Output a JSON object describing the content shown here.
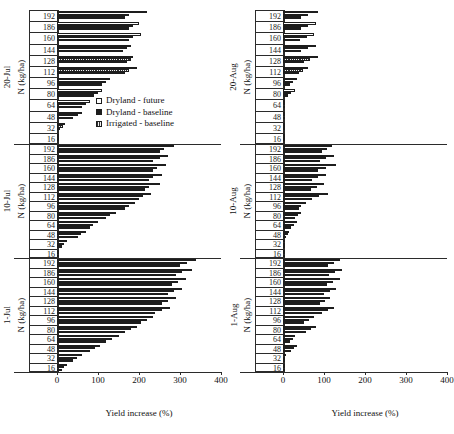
{
  "figure": {
    "xlabel": "Yield increase (%)",
    "ylabel": "N (kg/ha)",
    "legend": [
      {
        "key": "future",
        "label": "Dryland - future"
      },
      {
        "key": "baseline",
        "label": "Dryland - baseline"
      },
      {
        "key": "irrigated",
        "label": "Irrigated - baseline"
      }
    ],
    "xticks": [
      "0",
      "100",
      "200",
      "300",
      "400"
    ],
    "xlim": [
      0,
      400
    ],
    "categories": [
      "16",
      "32",
      "48",
      "64",
      "80",
      "96",
      "112",
      "128",
      "144",
      "160",
      "186",
      "192"
    ]
  },
  "chart_data": {
    "type": "bar",
    "title": "",
    "orientation": "horizontal",
    "xlabel": "Yield increase (%)",
    "ylabel": "N (kg/ha)",
    "xlim": [
      0,
      400
    ],
    "xticks": [
      0,
      100,
      200,
      300,
      400
    ],
    "grid": false,
    "legend_position": "inside-top-left-panel",
    "categories": [
      "16",
      "32",
      "48",
      "64",
      "80",
      "96",
      "112",
      "128",
      "144",
      "160",
      "186",
      "192"
    ],
    "series_names": [
      "Dryland - future",
      "Dryland - baseline",
      "Irrigated - baseline"
    ],
    "panels": [
      {
        "id": "20-jul",
        "label": "20-Jul",
        "column": "left",
        "row": 0,
        "series": [
          {
            "name": "Dryland - future",
            "key": "future",
            "values": [
              0,
              20,
              60,
              80,
              110,
              130,
              195,
              185,
              180,
              205,
              200,
              220
            ]
          },
          {
            "name": "Dryland - baseline",
            "key": "baseline",
            "values": [
              0,
              8,
              40,
              60,
              90,
              110,
              165,
              170,
              160,
              175,
              175,
              165
            ]
          },
          {
            "name": "Irrigated - baseline",
            "key": "irrigated",
            "values": [
              0,
              15,
              50,
              70,
              100,
              120,
              175,
              180,
              170,
              185,
              185,
              175
            ]
          }
        ]
      },
      {
        "id": "10-jul",
        "label": "10-Jul",
        "column": "left",
        "row": 1,
        "series": [
          {
            "name": "Dryland - future",
            "key": "future",
            "values": [
              5,
              25,
              70,
              100,
              145,
              190,
              230,
              250,
              255,
              265,
              270,
              285
            ]
          },
          {
            "name": "Dryland - baseline",
            "key": "baseline",
            "values": [
              2,
              12,
              50,
              80,
              120,
              165,
              200,
              215,
              225,
              235,
              235,
              250
            ]
          },
          {
            "name": "Irrigated - baseline",
            "key": "irrigated",
            "values": [
              3,
              18,
              58,
              88,
              130,
              175,
              210,
              225,
              235,
              245,
              250,
              262
            ]
          }
        ]
      },
      {
        "id": "1-jul",
        "label": "1-Jul",
        "column": "left",
        "row": 2,
        "series": [
          {
            "name": "Dryland - future",
            "key": "future",
            "values": [
              25,
              60,
              105,
              150,
              195,
              235,
              275,
              290,
              305,
              315,
              330,
              340
            ]
          },
          {
            "name": "Dryland - baseline",
            "key": "baseline",
            "values": [
              12,
              38,
              80,
              120,
              165,
              205,
              240,
              255,
              270,
              280,
              290,
              300
            ]
          },
          {
            "name": "Irrigated - baseline",
            "key": "irrigated",
            "values": [
              18,
              48,
              92,
              135,
              180,
              220,
              255,
              270,
              285,
              295,
              305,
              318
            ]
          }
        ]
      },
      {
        "id": "20-aug",
        "label": "20-Aug",
        "column": "right",
        "row": 0,
        "series": [
          {
            "name": "Dryland - future",
            "key": "future",
            "values": [
              0,
              2,
              4,
              6,
              30,
              35,
              60,
              85,
              80,
              75,
              80,
              85
            ]
          },
          {
            "name": "Dryland - baseline",
            "key": "baseline",
            "values": [
              0,
              1,
              2,
              3,
              12,
              16,
              40,
              50,
              45,
              42,
              45,
              45
            ]
          },
          {
            "name": "Irrigated - baseline",
            "key": "irrigated",
            "values": [
              0,
              1,
              3,
              4,
              20,
              25,
              48,
              65,
              60,
              58,
              60,
              62
            ]
          }
        ]
      },
      {
        "id": "10-aug",
        "label": "10-Aug",
        "column": "right",
        "row": 1,
        "series": [
          {
            "name": "Dryland - future",
            "key": "future",
            "values": [
              0,
              0,
              15,
              35,
              45,
              55,
              110,
              100,
              105,
              130,
              125,
              120
            ]
          },
          {
            "name": "Dryland - baseline",
            "key": "baseline",
            "values": [
              0,
              0,
              8,
              20,
              30,
              38,
              70,
              68,
              70,
              85,
              90,
              95
            ]
          },
          {
            "name": "Irrigated - baseline",
            "key": "irrigated",
            "values": [
              0,
              0,
              11,
              26,
              36,
              45,
              88,
              82,
              86,
              105,
              105,
              108
            ]
          }
        ]
      },
      {
        "id": "1-aug",
        "label": "1-Aug",
        "column": "right",
        "row": 2,
        "series": [
          {
            "name": "Dryland - future",
            "key": "future",
            "values": [
              0,
              8,
              35,
              30,
              80,
              75,
              125,
              115,
              130,
              140,
              145,
              140
            ]
          },
          {
            "name": "Dryland - baseline",
            "key": "baseline",
            "values": [
              0,
              4,
              20,
              18,
              55,
              52,
              95,
              90,
              100,
              108,
              112,
              110
            ]
          },
          {
            "name": "Irrigated - baseline",
            "key": "irrigated",
            "values": [
              0,
              6,
              28,
              24,
              68,
              64,
              110,
              102,
              115,
              122,
              128,
              125
            ]
          }
        ]
      }
    ]
  }
}
